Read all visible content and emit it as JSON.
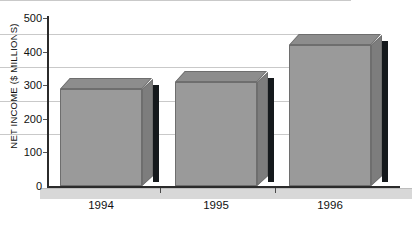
{
  "chart_data": {
    "type": "bar",
    "title": "",
    "subtitle": "",
    "xlabel": "",
    "ylabel": "NET INCOME ($ MILLIONS)",
    "categories": [
      "1994",
      "1995",
      "1996"
    ],
    "values": [
      290,
      310,
      420
    ],
    "ylim": [
      0,
      500
    ],
    "yticks": [
      "0",
      "100",
      "200",
      "300",
      "400",
      "500"
    ],
    "ytick_values": [
      0,
      100,
      200,
      300,
      400,
      500
    ],
    "grid": true,
    "legend": "none",
    "style": "3d-column",
    "colors": {
      "bar_front": "#9a9a9a",
      "bar_top": "#8d8d8d",
      "bar_side": "#7d7d7d",
      "bar_outline": "#6e6e6e",
      "shadow": "#15191c",
      "gridline": "#c9c9c9",
      "axis": "#2b2b2b",
      "floor": "#d8d8d8",
      "plot_background": "#ffffff",
      "text": "#111111"
    }
  }
}
